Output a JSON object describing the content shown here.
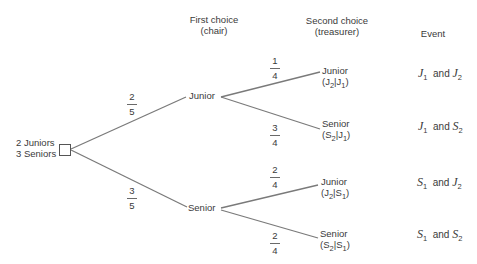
{
  "headers": {
    "first_choice_line1": "First choice",
    "first_choice_line2": "(chair)",
    "second_choice_line1": "Second choice",
    "second_choice_line2": "(treasurer)",
    "event": "Event"
  },
  "root": {
    "line1": "2 Juniors",
    "line2": "3 Seniors"
  },
  "first_level": [
    {
      "label": "Junior",
      "prob_num": "2",
      "prob_den": "5"
    },
    {
      "label": "Senior",
      "prob_num": "3",
      "prob_den": "5"
    }
  ],
  "second_level": [
    {
      "label": "Junior",
      "cond": "(J2|J1)",
      "cond_a": "J",
      "cond_a_sub": "2",
      "cond_b": "J",
      "cond_b_sub": "1",
      "prob_num": "1",
      "prob_den": "4",
      "event_a": "J",
      "event_a_sub": "1",
      "event_and": "and",
      "event_b": "J",
      "event_b_sub": "2"
    },
    {
      "label": "Senior",
      "cond": "(S2|J1)",
      "cond_a": "S",
      "cond_a_sub": "2",
      "cond_b": "J",
      "cond_b_sub": "1",
      "prob_num": "3",
      "prob_den": "4",
      "event_a": "J",
      "event_a_sub": "1",
      "event_and": "and",
      "event_b": "S",
      "event_b_sub": "2"
    },
    {
      "label": "Junior",
      "cond": "(J2|S1)",
      "cond_a": "J",
      "cond_a_sub": "2",
      "cond_b": "S",
      "cond_b_sub": "1",
      "prob_num": "2",
      "prob_den": "4",
      "event_a": "S",
      "event_a_sub": "1",
      "event_and": "and",
      "event_b": "J",
      "event_b_sub": "2"
    },
    {
      "label": "Senior",
      "cond": "(S2|S1)",
      "cond_a": "S",
      "cond_a_sub": "2",
      "cond_b": "S",
      "cond_b_sub": "1",
      "prob_num": "2",
      "prob_den": "4",
      "event_a": "S",
      "event_a_sub": "1",
      "event_and": "and",
      "event_b": "S",
      "event_b_sub": "2"
    }
  ],
  "colors": {
    "line": "#7a7a7a",
    "text": "#3a3a3a"
  }
}
